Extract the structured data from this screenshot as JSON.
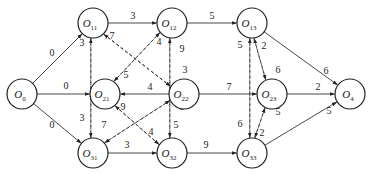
{
  "diagram": {
    "type": "directed-network",
    "nodes": [
      {
        "id": "O0",
        "main": "O",
        "sub": "0",
        "x": 22,
        "y": 94
      },
      {
        "id": "O11",
        "main": "O",
        "sub": "11",
        "x": 93,
        "y": 23
      },
      {
        "id": "O12",
        "main": "O",
        "sub": "12",
        "x": 172,
        "y": 23
      },
      {
        "id": "O13",
        "main": "O",
        "sub": "13",
        "x": 252,
        "y": 23
      },
      {
        "id": "O21",
        "main": "O",
        "sub": "21",
        "x": 105,
        "y": 94
      },
      {
        "id": "O22",
        "main": "O",
        "sub": "22",
        "x": 184,
        "y": 94
      },
      {
        "id": "O23",
        "main": "O",
        "sub": "23",
        "x": 272,
        "y": 94
      },
      {
        "id": "O31",
        "main": "O",
        "sub": "31",
        "x": 93,
        "y": 153
      },
      {
        "id": "O32",
        "main": "O",
        "sub": "32",
        "x": 172,
        "y": 153
      },
      {
        "id": "O33",
        "main": "O",
        "sub": "33",
        "x": 252,
        "y": 153
      },
      {
        "id": "O4",
        "main": "O",
        "sub": "4",
        "x": 350,
        "y": 94
      }
    ],
    "edges": [
      {
        "from": "O0",
        "to": "O11",
        "weight": "0",
        "style": "solid",
        "lx": 52,
        "ly": 56
      },
      {
        "from": "O0",
        "to": "O21",
        "weight": "0",
        "style": "solid",
        "lx": 66,
        "ly": 89
      },
      {
        "from": "O0",
        "to": "O31",
        "weight": "0",
        "style": "solid",
        "lx": 52,
        "ly": 128
      },
      {
        "from": "O11",
        "to": "O12",
        "weight": "3",
        "style": "solid",
        "lx": 133,
        "ly": 19
      },
      {
        "from": "O12",
        "to": "O13",
        "weight": "5",
        "style": "solid",
        "lx": 212,
        "ly": 19
      },
      {
        "from": "O13",
        "to": "O4",
        "weight": "6",
        "style": "solid",
        "lx": 326,
        "ly": 74
      },
      {
        "from": "O22",
        "to": "O21",
        "weight": "4",
        "style": "solid",
        "lx": 150,
        "ly": 90
      },
      {
        "from": "O22",
        "to": "O23",
        "weight": "7",
        "style": "solid",
        "lx": 229,
        "ly": 90
      },
      {
        "from": "O23",
        "to": "O4",
        "weight": "2",
        "style": "solid",
        "lx": 318,
        "ly": 90
      },
      {
        "from": "O31",
        "to": "O32",
        "weight": "3",
        "style": "solid",
        "lx": 127,
        "ly": 148
      },
      {
        "from": "O32",
        "to": "O33",
        "weight": "9",
        "style": "solid",
        "lx": 206,
        "ly": 148
      },
      {
        "from": "O33",
        "to": "O4",
        "weight": "5",
        "style": "solid",
        "lx": 329,
        "ly": 114
      },
      {
        "from": "O31",
        "to": "O11",
        "weight": "3",
        "style": "dashed",
        "lx": 82,
        "ly": 46
      },
      {
        "from": "O11",
        "to": "O31",
        "weight": "3",
        "style": "dashed",
        "lx": 82,
        "ly": 121
      },
      {
        "from": "O21",
        "to": "O12",
        "weight": "4",
        "style": "dashed",
        "lx": 159,
        "ly": 45
      },
      {
        "from": "O12",
        "to": "O21",
        "weight": "5",
        "style": "dashed",
        "lx": 126,
        "ly": 78
      },
      {
        "from": "O32",
        "to": "O12",
        "weight": "9",
        "style": "dashed",
        "lx": 182,
        "ly": 52
      },
      {
        "from": "O12",
        "to": "O32",
        "weight": "5",
        "style": "dashed",
        "lx": 176,
        "ly": 128
      },
      {
        "from": "O22",
        "to": "O11",
        "weight": "7",
        "style": "dashed",
        "lx": 112,
        "ly": 39
      },
      {
        "from": "O11",
        "to": "O22",
        "weight": "3",
        "style": "dashed",
        "lx": 185,
        "ly": 73
      },
      {
        "from": "O32",
        "to": "O21",
        "weight": "9",
        "style": "dashed",
        "lx": 123,
        "ly": 110
      },
      {
        "from": "O21",
        "to": "O32",
        "weight": "4",
        "style": "dashed",
        "lx": 151,
        "ly": 135
      },
      {
        "from": "O22",
        "to": "O31",
        "weight": "7",
        "style": "dashed",
        "lx": 104,
        "ly": 128
      },
      {
        "from": "O31",
        "to": "O22",
        "weight": "3",
        "style": "dashed",
        "lx": 182,
        "ly": 110
      },
      {
        "from": "O33",
        "to": "O13",
        "weight": "5",
        "style": "dashed",
        "lx": 240,
        "ly": 48
      },
      {
        "from": "O13",
        "to": "O33",
        "weight": "6",
        "style": "dashed",
        "lx": 240,
        "ly": 127
      },
      {
        "from": "O13",
        "to": "O23",
        "weight": "2",
        "style": "dashed",
        "lx": 264,
        "ly": 49
      },
      {
        "from": "O23",
        "to": "O13",
        "weight": "6",
        "style": "dashed",
        "lx": 278,
        "ly": 73
      },
      {
        "from": "O23",
        "to": "O33",
        "weight": "2",
        "style": "dashed",
        "lx": 262,
        "ly": 136
      },
      {
        "from": "O33",
        "to": "O23",
        "weight": "5",
        "style": "dashed",
        "lx": 278,
        "ly": 115
      }
    ]
  }
}
